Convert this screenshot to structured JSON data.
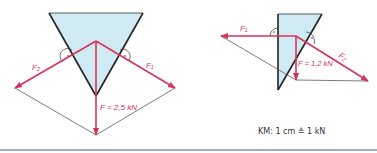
{
  "left_diagram": {
    "label_f2": "F₂",
    "label_f1": "F₁",
    "label_f": "F = 2,5 kN"
  },
  "right_diagram": {
    "label_f1": "F₁",
    "label_f2": "F₂",
    "label_f": "F = 1,2 kN"
  },
  "scale_caption": "KM: 1 cm ≙ 1 kN",
  "colors": {
    "force": "#d6335a",
    "wedge_fill": "#cfeaf3",
    "wedge_edge": "#222222",
    "separator": "#9aaec0"
  }
}
